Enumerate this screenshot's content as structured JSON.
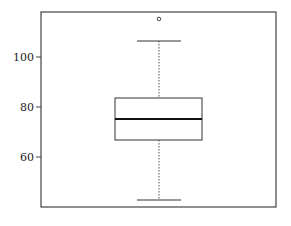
{
  "chart_data": {
    "type": "box",
    "title": "",
    "xlabel": "",
    "ylabel": "",
    "ylim": [
      40.4,
      118.4
    ],
    "yticks": [
      60,
      80,
      100
    ],
    "ytick_labels": [
      "60",
      "80",
      "100"
    ],
    "grid": false,
    "legend": null,
    "series": [
      {
        "name": "",
        "whisker_low": 42.8,
        "q1": 66.8,
        "median": 75.2,
        "q3": 83.6,
        "whisker_high": 106.4,
        "outliers": [
          115.2
        ]
      }
    ]
  },
  "colors": {
    "frame": "#444444",
    "box": "#333333",
    "median": "#111111",
    "whisker": "#555555"
  }
}
